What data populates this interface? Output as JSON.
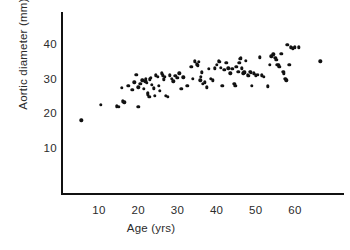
{
  "chart_data": {
    "type": "scatter",
    "title": "",
    "xlabel": "Age (yrs)",
    "ylabel": "Aortic diameter (mm)",
    "xlim": [
      0,
      72
    ],
    "ylim": [
      0,
      46
    ],
    "xticks": [
      10,
      20,
      30,
      40,
      50,
      60
    ],
    "yticks": [
      10,
      20,
      30,
      40
    ],
    "grid": false,
    "legend": null,
    "marker": "filled-circle",
    "marker_color": "#111111",
    "n_points": 118,
    "points": [
      [
        5.5,
        18.0
      ],
      [
        10.5,
        22.5
      ],
      [
        14.5,
        22.0
      ],
      [
        15.0,
        21.8
      ],
      [
        15.8,
        27.3
      ],
      [
        16.0,
        23.5
      ],
      [
        16.5,
        23.2
      ],
      [
        17.5,
        28.0
      ],
      [
        18.5,
        26.8
      ],
      [
        19.0,
        29.0
      ],
      [
        19.5,
        31.2
      ],
      [
        20.0,
        27.5
      ],
      [
        20.0,
        21.8
      ],
      [
        20.5,
        28.5
      ],
      [
        21.0,
        29.5
      ],
      [
        21.5,
        27.0
      ],
      [
        21.8,
        29.2
      ],
      [
        22.0,
        30.0
      ],
      [
        22.0,
        29.4
      ],
      [
        22.2,
        28.8
      ],
      [
        22.5,
        26.0
      ],
      [
        22.5,
        25.5
      ],
      [
        22.8,
        24.8
      ],
      [
        23.0,
        29.8
      ],
      [
        23.2,
        30.2
      ],
      [
        23.5,
        28.2
      ],
      [
        24.0,
        27.2
      ],
      [
        24.2,
        25.0
      ],
      [
        24.5,
        31.0
      ],
      [
        25.0,
        30.6
      ],
      [
        25.2,
        28.0
      ],
      [
        25.5,
        26.5
      ],
      [
        26.0,
        31.5
      ],
      [
        26.2,
        31.0
      ],
      [
        26.5,
        29.8
      ],
      [
        26.8,
        30.5
      ],
      [
        27.0,
        25.0
      ],
      [
        27.5,
        24.8
      ],
      [
        28.0,
        31.0
      ],
      [
        28.5,
        30.0
      ],
      [
        29.0,
        29.2
      ],
      [
        29.5,
        30.8
      ],
      [
        30.0,
        30.2
      ],
      [
        30.5,
        31.5
      ],
      [
        31.0,
        27.0
      ],
      [
        31.5,
        30.4
      ],
      [
        32.5,
        28.0
      ],
      [
        33.5,
        33.5
      ],
      [
        34.0,
        30.0
      ],
      [
        34.5,
        35.0
      ],
      [
        35.0,
        34.2
      ],
      [
        35.2,
        33.8
      ],
      [
        35.5,
        34.8
      ],
      [
        35.8,
        29.5
      ],
      [
        36.0,
        30.5
      ],
      [
        36.2,
        31.8
      ],
      [
        36.5,
        28.5
      ],
      [
        37.0,
        29.0
      ],
      [
        37.5,
        27.5
      ],
      [
        38.0,
        32.8
      ],
      [
        38.5,
        30.0
      ],
      [
        39.0,
        29.5
      ],
      [
        39.5,
        33.0
      ],
      [
        40.0,
        34.0
      ],
      [
        40.5,
        35.0
      ],
      [
        40.8,
        34.8
      ],
      [
        41.0,
        33.2
      ],
      [
        41.5,
        28.0
      ],
      [
        42.0,
        32.5
      ],
      [
        42.5,
        34.5
      ],
      [
        43.0,
        33.0
      ],
      [
        43.5,
        31.5
      ],
      [
        44.0,
        32.8
      ],
      [
        44.5,
        28.5
      ],
      [
        44.8,
        28.0
      ],
      [
        45.0,
        33.5
      ],
      [
        45.5,
        32.0
      ],
      [
        45.8,
        34.5
      ],
      [
        46.0,
        35.8
      ],
      [
        46.2,
        36.0
      ],
      [
        46.5,
        33.0
      ],
      [
        46.8,
        31.5
      ],
      [
        47.0,
        32.0
      ],
      [
        47.2,
        31.8
      ],
      [
        47.5,
        35.2
      ],
      [
        48.0,
        31.0
      ],
      [
        48.2,
        30.8
      ],
      [
        48.5,
        32.0
      ],
      [
        48.8,
        31.8
      ],
      [
        49.0,
        28.0
      ],
      [
        49.5,
        31.5
      ],
      [
        50.0,
        31.0
      ],
      [
        50.5,
        31.2
      ],
      [
        51.0,
        36.2
      ],
      [
        51.5,
        31.0
      ],
      [
        52.0,
        30.5
      ],
      [
        53.0,
        27.8
      ],
      [
        53.5,
        34.0
      ],
      [
        54.0,
        36.5
      ],
      [
        54.5,
        37.0
      ],
      [
        55.0,
        36.0
      ],
      [
        55.2,
        35.5
      ],
      [
        55.5,
        34.0
      ],
      [
        55.8,
        33.8
      ],
      [
        56.0,
        33.5
      ],
      [
        56.5,
        37.2
      ],
      [
        57.0,
        32.0
      ],
      [
        57.2,
        31.5
      ],
      [
        57.5,
        30.0
      ],
      [
        57.8,
        29.5
      ],
      [
        58.0,
        39.8
      ],
      [
        58.5,
        34.0
      ],
      [
        59.0,
        39.0
      ],
      [
        59.5,
        38.8
      ],
      [
        60.0,
        39.0
      ],
      [
        61.0,
        39.0
      ],
      [
        66.5,
        35.0
      ]
    ]
  },
  "axes": {
    "x_tick_labels": [
      "10",
      "20",
      "30",
      "40",
      "50",
      "60"
    ],
    "y_tick_labels": [
      "10",
      "20",
      "30",
      "40"
    ],
    "x_axis_title": "Age (yrs)",
    "y_axis_title": "Aortic diameter (mm)"
  }
}
